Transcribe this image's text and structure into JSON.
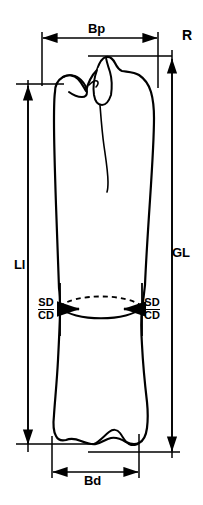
{
  "figure": {
    "kind": "osteometric-bone-measurement-diagram",
    "specimen_label": "R",
    "background_color": "#ffffff",
    "line_color": "#000000"
  },
  "labels": {
    "proximal_breadth": "Bp",
    "side_marker": "R",
    "greatest_length": "GL",
    "lateral_length": "Ll",
    "smallest_diameter": "SD",
    "circumference_diameter": "CD",
    "distal_breadth": "Bd"
  },
  "measurements": [
    {
      "id": "bp",
      "code": "Bp",
      "orientation": "horizontal",
      "position": "top",
      "arrow_heads": "both",
      "span_px": {
        "x1": 42,
        "x2": 158,
        "y": 38
      }
    },
    {
      "id": "r",
      "code": "R",
      "orientation": "none",
      "position": "top-right",
      "arrow_heads": "none"
    },
    {
      "id": "gl",
      "code": "GL",
      "orientation": "vertical",
      "position": "right",
      "arrow_heads": "both",
      "span_px": {
        "x": 172,
        "y1": 58,
        "y2": 452
      }
    },
    {
      "id": "ll",
      "code": "Ll",
      "orientation": "vertical",
      "position": "left",
      "arrow_heads": "both",
      "span_px": {
        "x": 28,
        "y1": 85,
        "y2": 445
      }
    },
    {
      "id": "sd_cd_left",
      "code": "SD / CD",
      "orientation": "horizontal",
      "position": "mid-shaft-left",
      "arrow_heads": "right",
      "span_px": {
        "x1": 62,
        "x2": 82,
        "y": 309
      }
    },
    {
      "id": "sd_cd_right",
      "code": "SD / CD",
      "orientation": "horizontal",
      "position": "mid-shaft-right",
      "arrow_heads": "left",
      "span_px": {
        "x1": 141,
        "x2": 120,
        "y": 309
      }
    },
    {
      "id": "bd",
      "code": "Bd",
      "orientation": "horizontal",
      "position": "bottom",
      "arrow_heads": "both",
      "span_px": {
        "x1": 52,
        "x2": 139,
        "y": 472
      }
    }
  ],
  "cross_section": {
    "shape": "lens-ellipse",
    "upper_arc_style": "dashed",
    "lower_arc_style": "solid",
    "center_px": {
      "x": 101,
      "y": 307
    }
  }
}
